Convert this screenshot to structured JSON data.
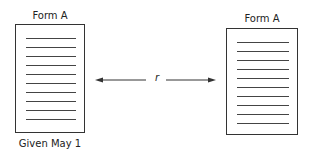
{
  "diagram": {
    "left_form": {
      "title": "Form A",
      "caption": "Given May 1",
      "line_count": 10
    },
    "right_form": {
      "title": "Form A",
      "line_count": 10
    },
    "connector": {
      "label": "r",
      "type": "double-headed-arrow"
    }
  }
}
